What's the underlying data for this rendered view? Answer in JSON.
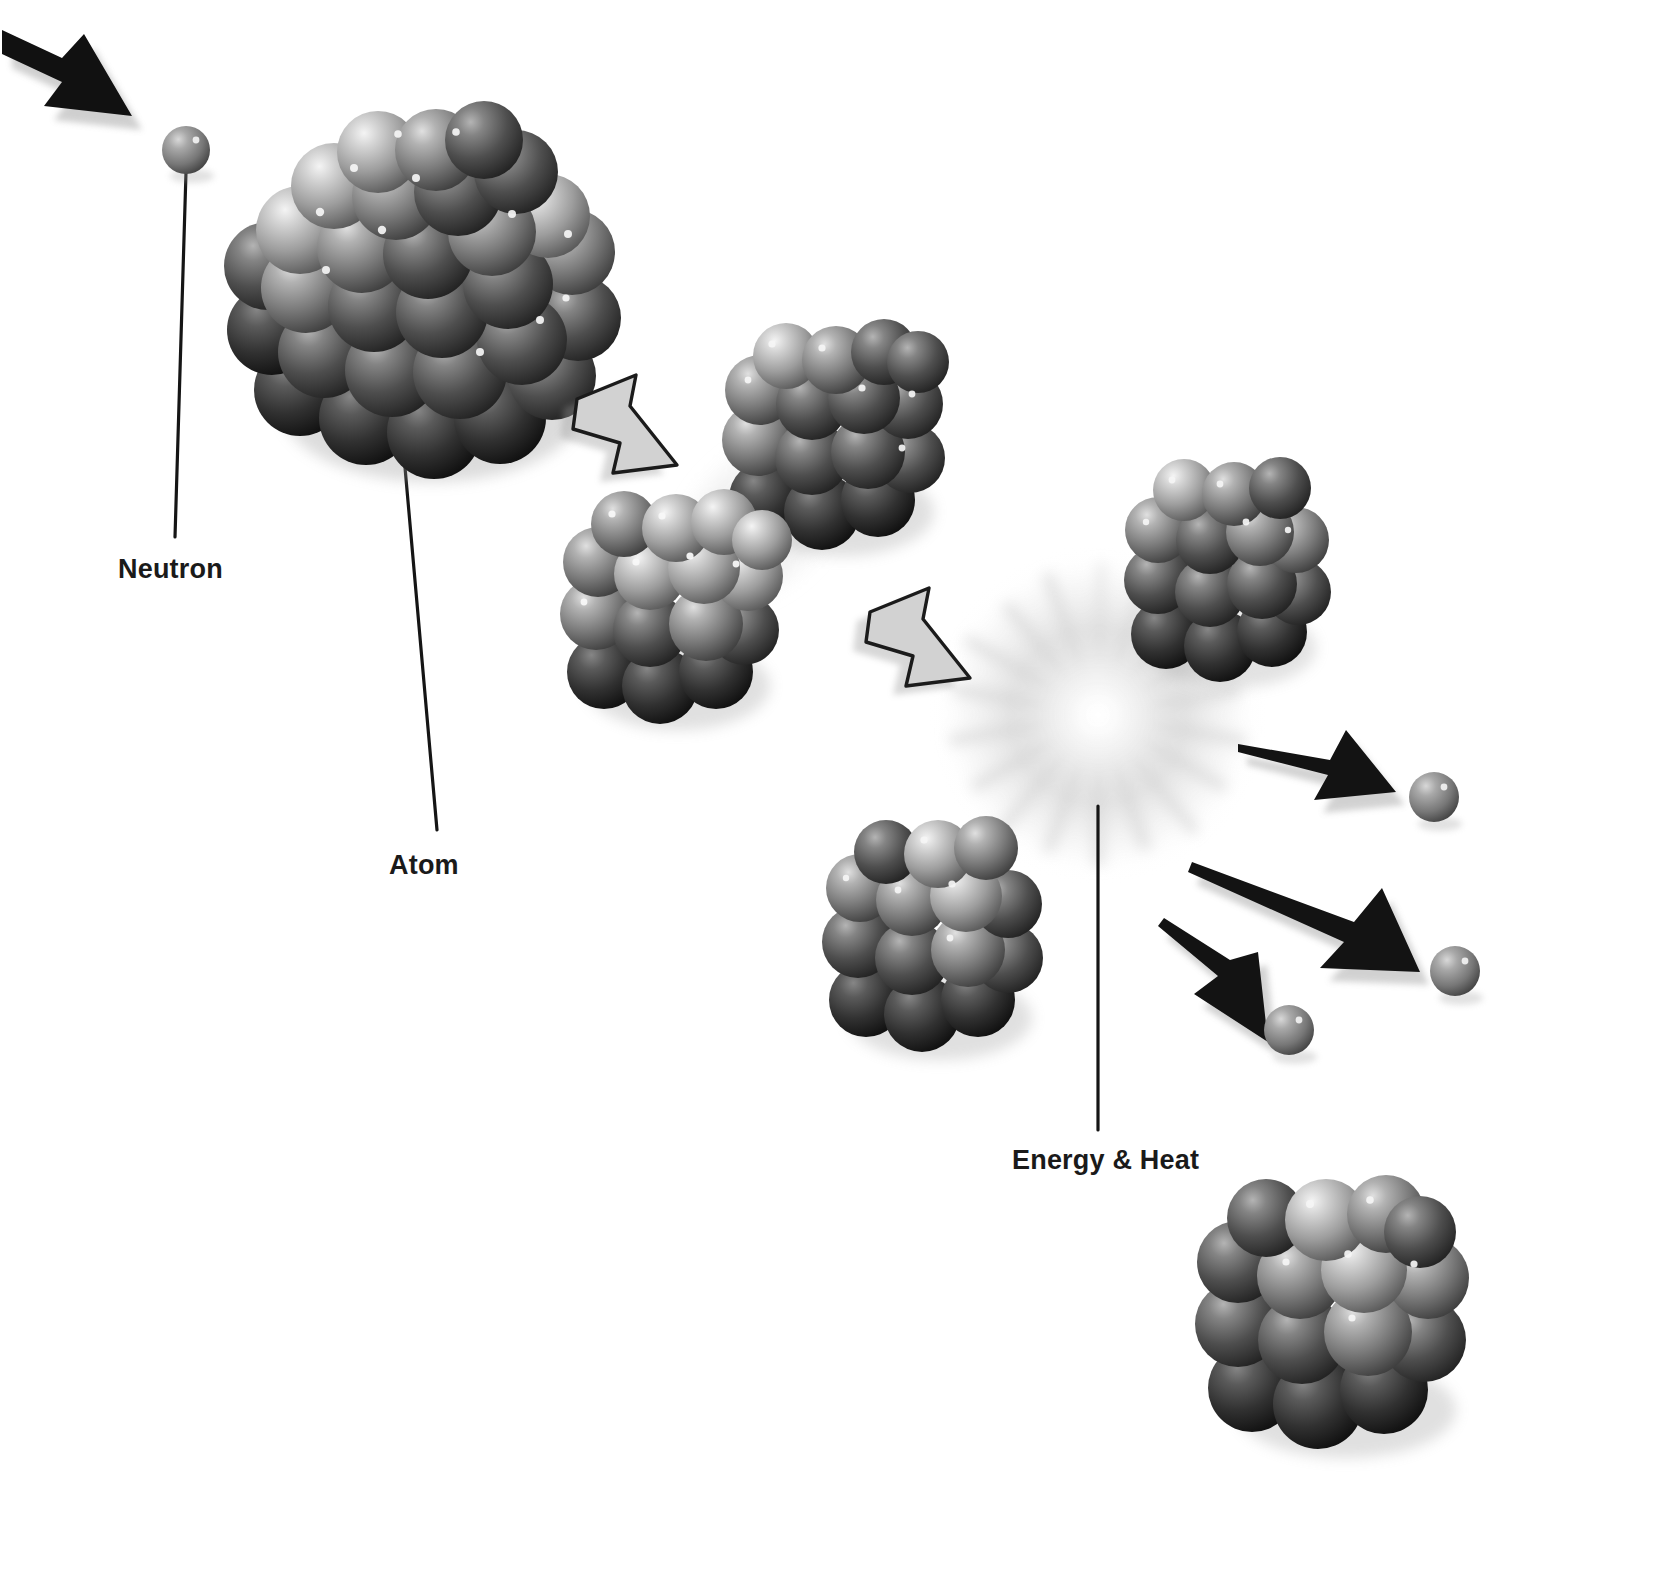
{
  "figure": {
    "background_color": "#ffffff",
    "width": 1672,
    "height": 1577,
    "style": "grayscale 3D rendered illustration"
  },
  "labels": [
    {
      "id": "neutron",
      "text": "Neutron",
      "x": 118,
      "y": 554,
      "color": "#1a1a1a",
      "leader_line": {
        "from_x": 186,
        "from_y": 172,
        "to_x": 175,
        "to_y": 535
      }
    },
    {
      "id": "atom",
      "text": "Atom",
      "x": 389,
      "y": 850,
      "color": "#1a1a1a",
      "leader_line": {
        "from_x": 404,
        "from_y": 455,
        "to_x": 437,
        "to_y": 828
      }
    },
    {
      "id": "energy_heat",
      "text": "Energy & Heat",
      "x": 1012,
      "y": 1145,
      "color": "#1a1a1a",
      "leader_line": {
        "from_x": 1098,
        "from_y": 805,
        "to_x": 1098,
        "to_y": 1128
      }
    }
  ],
  "neutrons": [
    {
      "id": "incoming-neutron",
      "cx": 186,
      "cy": 150,
      "r": 23,
      "color": "#6e6e6e"
    },
    {
      "id": "emitted-neutron-1",
      "cx": 1434,
      "cy": 797,
      "r": 24,
      "color": "#6e6e6e"
    },
    {
      "id": "emitted-neutron-2",
      "cx": 1455,
      "cy": 971,
      "r": 24,
      "color": "#6e6e6e"
    },
    {
      "id": "emitted-neutron-3",
      "cx": 1289,
      "cy": 1030,
      "r": 24,
      "color": "#6e6e6e"
    }
  ],
  "atoms": [
    {
      "id": "atom-intact-large",
      "cx": 418,
      "cy": 295,
      "r": 165,
      "nucleons": 46,
      "state": "intact"
    },
    {
      "id": "atom-splitting-upper",
      "cx": 833,
      "cy": 432,
      "r": 100,
      "nucleons": 26,
      "state": "splitting"
    },
    {
      "id": "atom-splitting-lower",
      "cx": 668,
      "cy": 604,
      "r": 100,
      "nucleons": 26,
      "state": "splitting"
    },
    {
      "id": "atom-product-right",
      "cx": 1225,
      "cy": 566,
      "r": 92,
      "nucleons": 24,
      "state": "product"
    },
    {
      "id": "atom-product-lower-left",
      "cx": 933,
      "cy": 930,
      "r": 100,
      "nucleons": 26,
      "state": "product"
    },
    {
      "id": "atom-product-bottom-right",
      "cx": 1337,
      "cy": 1297,
      "r": 120,
      "nucleons": 30,
      "state": "product"
    }
  ],
  "arrows": {
    "incoming": {
      "id": "incoming-neutron-arrow",
      "style": "solid-black",
      "from_x": 36,
      "from_y": 48,
      "to_x": 132,
      "to_y": 115,
      "color": "#111111"
    },
    "process": [
      {
        "id": "process-arrow-1",
        "style": "outlined-gray",
        "cx": 628,
        "cy": 425,
        "angle": 45,
        "fill": "#d2d2d2",
        "stroke": "#1b1b1b"
      },
      {
        "id": "process-arrow-2",
        "style": "outlined-gray",
        "cx": 920,
        "cy": 637,
        "angle": 45,
        "fill": "#d2d2d2",
        "stroke": "#1b1b1b"
      }
    ],
    "emitted": [
      {
        "id": "emitted-arrow-1",
        "style": "solid-black",
        "from_x": 1248,
        "from_y": 760,
        "to_x": 1390,
        "to_y": 790,
        "color": "#131313"
      },
      {
        "id": "emitted-arrow-2",
        "style": "solid-black",
        "from_x": 1200,
        "from_y": 872,
        "to_x": 1412,
        "to_y": 941,
        "color": "#131313"
      },
      {
        "id": "emitted-arrow-3",
        "style": "solid-black",
        "from_x": 1168,
        "from_y": 930,
        "to_x": 1268,
        "to_y": 1000,
        "color": "#131313"
      }
    ]
  },
  "energy_burst": {
    "id": "energy-burst",
    "cx": 1098,
    "cy": 715,
    "radius": 165,
    "ray_count": 18,
    "color": "#b8b8b8",
    "description": "radial starburst glow representing released energy and heat"
  },
  "palette": {
    "background": "#ffffff",
    "nucleon_light": "#c9c9c9",
    "nucleon_mid": "#8a8a8a",
    "nucleon_dark": "#3a3a3a",
    "nucleon_darkest": "#1e1e1e",
    "highlight": "#f2f2f2",
    "arrow_black": "#131313",
    "arrow_outline_fill": "#d2d2d2",
    "label_text": "#1a1a1a",
    "shadow": "#9a9a9a"
  }
}
